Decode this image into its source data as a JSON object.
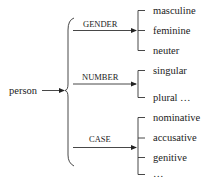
{
  "diagram": {
    "root": "person",
    "categories": [
      {
        "label": "GENDER",
        "values": [
          "masculine",
          "feminine",
          "neuter"
        ]
      },
      {
        "label": "NUMBER",
        "values": [
          "singular",
          "plural …"
        ]
      },
      {
        "label": "CASE",
        "values": [
          "nominative",
          "accusative",
          "genitive",
          "…"
        ]
      }
    ]
  }
}
